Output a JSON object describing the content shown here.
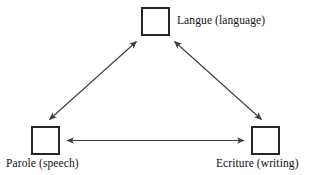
{
  "diagram": {
    "type": "triangle-relationship-diagram",
    "background_color": "#ffffff",
    "line_color": "#3c3c46",
    "box_border_color": "#262626",
    "text_color": "#111111",
    "nodes": [
      {
        "id": "langue",
        "label": "Langue (language)",
        "position": "top",
        "shape": "square"
      },
      {
        "id": "parole",
        "label": "Parole (speech)",
        "position": "bottom-left",
        "shape": "square"
      },
      {
        "id": "ecriture",
        "label": "Ecriture (writing)",
        "position": "bottom-right",
        "shape": "square"
      }
    ],
    "edges": [
      {
        "id": "langue-parole",
        "from": "langue",
        "to": "parole",
        "style": "double-headed-arrow"
      },
      {
        "id": "langue-ecriture",
        "from": "langue",
        "to": "ecriture",
        "style": "double-headed-arrow"
      },
      {
        "id": "parole-ecriture",
        "from": "parole",
        "to": "ecriture",
        "style": "double-headed-arrow"
      }
    ]
  }
}
